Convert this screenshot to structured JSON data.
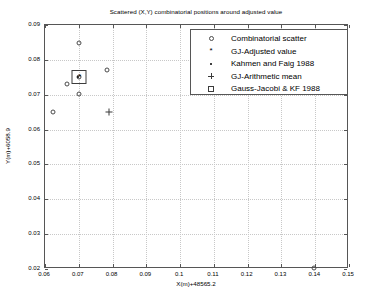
{
  "chart_data": {
    "type": "scatter",
    "title": "Scattered (X,Y) combinatorial positions around adjusted value",
    "xlabel": "X(m)+48565.2",
    "ylabel": "Y(m)+6058.9",
    "xlim": [
      0.06,
      0.15
    ],
    "ylim": [
      0.02,
      0.09
    ],
    "xticks": [
      "0.06",
      "0.07",
      "0.08",
      "0.09",
      "0.1",
      "0.11",
      "0.12",
      "0.13",
      "0.14",
      "0.15"
    ],
    "yticks": [
      "0.02",
      "0.03",
      "0.04",
      "0.05",
      "0.06",
      "0.07",
      "0.08",
      "0.09"
    ],
    "grid": true,
    "legend_position": "top-right",
    "series": [
      {
        "name": "Combinatorial scatter",
        "marker": "circle-open",
        "points": [
          {
            "x": 0.0625,
            "y": 0.065
          },
          {
            "x": 0.0665,
            "y": 0.073
          },
          {
            "x": 0.07,
            "y": 0.0849
          },
          {
            "x": 0.07,
            "y": 0.0703
          },
          {
            "x": 0.0702,
            "y": 0.0752
          },
          {
            "x": 0.0785,
            "y": 0.077
          },
          {
            "x": 0.1395,
            "y": 0.0203
          }
        ]
      },
      {
        "name": "GJ-Adjusted value",
        "marker": "asterisk",
        "points": [
          {
            "x": 0.0703,
            "y": 0.0752
          }
        ]
      },
      {
        "name": "Kahmen and Faig 1988",
        "marker": "dot",
        "points": [
          {
            "x": 0.0699,
            "y": 0.0752
          }
        ]
      },
      {
        "name": "GJ-Arithmetic mean",
        "marker": "plus",
        "points": [
          {
            "x": 0.079,
            "y": 0.065
          }
        ]
      },
      {
        "name": "Gauss-Jacobi & KF 1988",
        "marker": "square-open",
        "points": [
          {
            "x": 0.0701,
            "y": 0.0752
          }
        ]
      }
    ]
  },
  "legend": {
    "items": [
      {
        "symbol": "circle-open",
        "label": "Combinatorial scatter"
      },
      {
        "symbol": "asterisk",
        "label": "GJ-Adjusted value"
      },
      {
        "symbol": "dot",
        "label": "Kahmen and Faig 1988"
      },
      {
        "symbol": "plus",
        "label": "GJ-Arithmetic mean"
      },
      {
        "symbol": "square-open",
        "label": "Gauss-Jacobi & KF 1988"
      }
    ]
  }
}
